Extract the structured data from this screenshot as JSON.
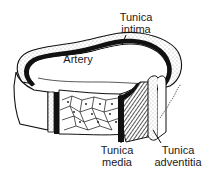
{
  "figure": {
    "type": "labeled anatomical cross-section illustration",
    "labels": {
      "lumen": "Artery",
      "intima": [
        "Tunica",
        "intima"
      ],
      "media": [
        "Tunica",
        "media"
      ],
      "adventitia": [
        "Tunica",
        "adventitia"
      ]
    },
    "colors": {
      "ink": "#111111",
      "paper": "#ffffff",
      "stipple": "#555555"
    }
  }
}
